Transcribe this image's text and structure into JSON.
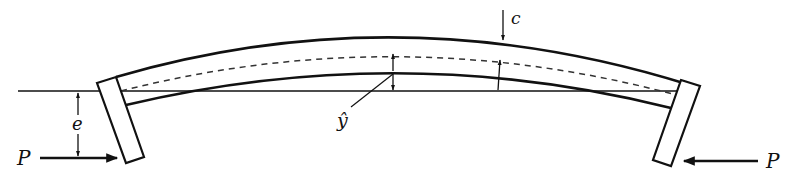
{
  "diagram": {
    "type": "eccentrically loaded curved column (beam-column with end plates)",
    "colors": {
      "stroke": "#111111",
      "background": "#ffffff"
    },
    "labels": {
      "load_left": "P",
      "load_right": "P",
      "eccentricity": "e",
      "half_depth": "c",
      "deflection": "ŷ"
    },
    "elements": [
      "reference-line (line of action of P)",
      "beam top edge (curved)",
      "beam centroidal axis (dashed, curved)",
      "beam bottom edge (curved)",
      "left end plate",
      "right end plate",
      "left load arrow (pointing right)",
      "right load arrow (pointing left)",
      "eccentricity dimension arrows",
      "half-depth c arrow",
      "deflection ŷ dimension arrows with leader",
      "deflection arrow near right"
    ]
  }
}
